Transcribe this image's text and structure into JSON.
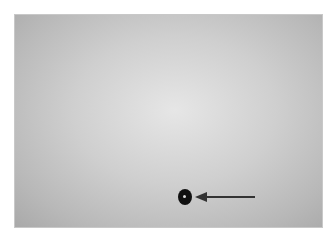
{
  "figure": {
    "type": "grayscale clinical photograph",
    "annotation": {
      "kind": "arrow",
      "direction": "left",
      "points_to": "dark circular spot",
      "color": "#333333"
    },
    "marker_color": "#111111",
    "background_tone": "#cfcfcf"
  }
}
